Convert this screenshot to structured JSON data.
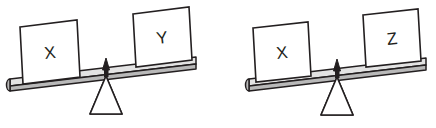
{
  "figure": {
    "type": "balance-scale-pair",
    "background_color": "#ffffff",
    "stroke_color": "#231f20",
    "beam_top_color": "#e3e3e3",
    "beam_side_color": "#b9b9b9",
    "fulcrum_stripe_color": "#b0b0b0",
    "box_fill_color": "#ffffff"
  },
  "scales": [
    {
      "id": "scale-1",
      "tilt": "left-down",
      "left": {
        "label": "X",
        "position": "down",
        "side": "left"
      },
      "right": {
        "label": "Y",
        "position": "up",
        "side": "right"
      },
      "relation": "X > Y"
    },
    {
      "id": "scale-2",
      "tilt": "left-down",
      "left": {
        "label": "X",
        "position": "down",
        "side": "left"
      },
      "right": {
        "label": "Z",
        "position": "up",
        "side": "right"
      },
      "relation": "X > Z"
    }
  ]
}
